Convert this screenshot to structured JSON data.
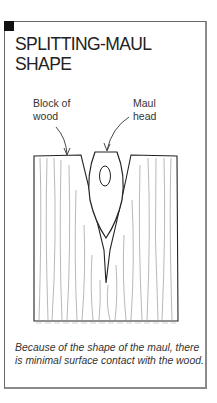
{
  "figure": {
    "title_line1": "SPLITTING-MAUL",
    "title_line2": "SHAPE",
    "labels": {
      "block": [
        "Block of",
        "wood"
      ],
      "maul": [
        "Maul",
        "head"
      ]
    },
    "caption": "Because of the shape of the maul, there is minimal surface contact with the wood.",
    "icons": {
      "corner_marker": "black-square",
      "illustration": "wood-block-with-maul-head"
    },
    "colors": {
      "line": "#222222",
      "grain": "#9a9a9a",
      "frame": "#6a6a6a",
      "corner": "#111111"
    }
  }
}
